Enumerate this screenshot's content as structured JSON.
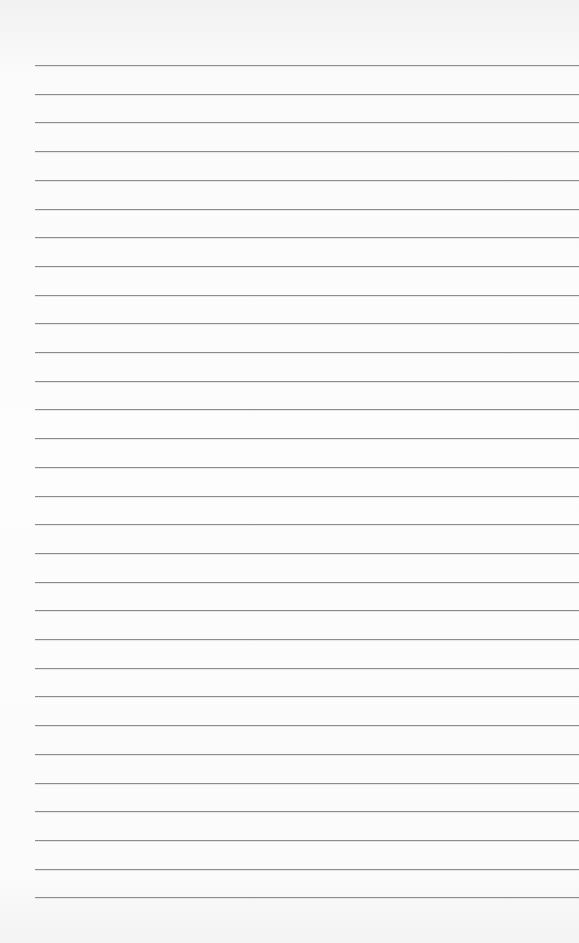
{
  "paper": {
    "type": "lined-paper",
    "line_count": 30,
    "first_line_y": 65,
    "line_spacing": 28.7,
    "line_left_x": 35,
    "line_color": "#8c8c8c",
    "background_color": "#fdfdfd"
  }
}
